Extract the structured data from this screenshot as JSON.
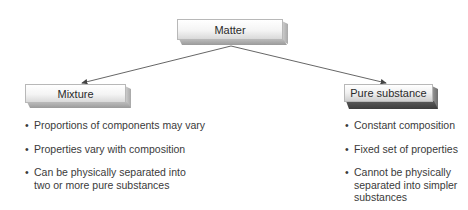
{
  "diagram": {
    "root": {
      "label": "Matter"
    },
    "branches": [
      {
        "label": "Mixture",
        "properties": [
          "Proportions of components may vary",
          "Properties vary with composition",
          "Can be physically separated into two or more pure substances"
        ]
      },
      {
        "label": "Pure substance",
        "properties": [
          "Constant composition",
          "Fixed set of properties",
          "Cannot be physically separated into simpler substances"
        ]
      }
    ],
    "edges": [
      {
        "from": "Matter",
        "to": "Mixture"
      },
      {
        "from": "Matter",
        "to": "Pure substance"
      }
    ]
  }
}
